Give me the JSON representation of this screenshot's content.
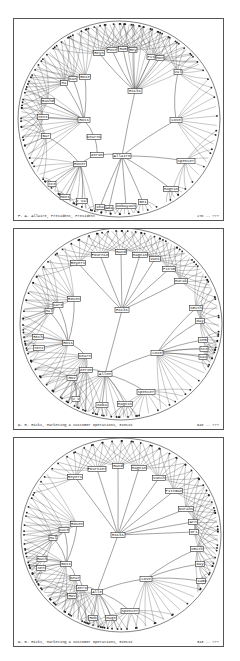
{
  "figure": {
    "panels": [
      {
        "id": "panel-1",
        "top": 18,
        "height": 203,
        "footer": {
          "left": "F. A. Allaire, President, President",
          "right": "278 -- ???"
        },
        "disc": {
          "cx": 105,
          "cy": 100,
          "rx": 101,
          "ry": 98
        },
        "root": "Allaire",
        "nodes": [
          {
            "id": "Allaire",
            "x": 108,
            "y": 137,
            "w": 18
          },
          {
            "id": "Hicks",
            "x": 121,
            "y": 72,
            "w": 14
          },
          {
            "id": "Love",
            "x": 162,
            "y": 101,
            "w": 12
          },
          {
            "id": "Spencer",
            "x": 172,
            "y": 142,
            "w": 18
          },
          {
            "id": "Magnin",
            "x": 157,
            "y": 170,
            "w": 15
          },
          {
            "id": "Bei",
            "x": 129,
            "y": 183,
            "w": 9
          },
          {
            "id": "Kobayash",
            "x": 112,
            "y": 187,
            "w": 20
          },
          {
            "id": "Ada",
            "x": 95,
            "y": 189,
            "w": 8
          },
          {
            "id": "Cha",
            "x": 86,
            "y": 188,
            "w": 9
          },
          {
            "id": "Zeron",
            "x": 83,
            "y": 136,
            "w": 13
          },
          {
            "id": "Kearns",
            "x": 80,
            "y": 118,
            "w": 14
          },
          {
            "id": "Ross",
            "x": 70,
            "y": 101,
            "w": 12
          },
          {
            "id": "Hover",
            "x": 66,
            "y": 145,
            "w": 13
          },
          {
            "id": "Bar",
            "x": 32,
            "y": 117,
            "w": 9
          },
          {
            "id": "Ste",
            "x": 38,
            "y": 165,
            "w": 8
          },
          {
            "id": "Mont",
            "x": 51,
            "y": 178,
            "w": 10
          },
          {
            "id": "J Val",
            "x": 68,
            "y": 182,
            "w": 11
          },
          {
            "id": "Rashd",
            "x": 34,
            "y": 82,
            "w": 13
          },
          {
            "id": "Sent",
            "x": 29,
            "y": 98,
            "w": 11
          },
          {
            "id": "Ma",
            "x": 50,
            "y": 64,
            "w": 7
          },
          {
            "id": "Can",
            "x": 59,
            "y": 60,
            "w": 8
          },
          {
            "id": "Rose",
            "x": 71,
            "y": 58,
            "w": 11
          },
          {
            "id": "Reyn",
            "x": 85,
            "y": 34,
            "w": 11
          },
          {
            "id": "Four",
            "x": 98,
            "y": 31,
            "w": 10
          },
          {
            "id": "Ham",
            "x": 109,
            "y": 30,
            "w": 9
          },
          {
            "id": "Rey",
            "x": 119,
            "y": 31,
            "w": 8
          },
          {
            "id": "Pit",
            "x": 137,
            "y": 38,
            "w": 8
          },
          {
            "id": "Mon",
            "x": 146,
            "y": 39,
            "w": 8
          },
          {
            "id": "Val",
            "x": 164,
            "y": 53,
            "w": 8
          }
        ],
        "edges": [
          [
            "Allaire",
            "Hicks"
          ],
          [
            "Allaire",
            "Love"
          ],
          [
            "Allaire",
            "Spencer"
          ],
          [
            "Allaire",
            "Magnin"
          ],
          [
            "Allaire",
            "Bei"
          ],
          [
            "Allaire",
            "Kobayash"
          ],
          [
            "Allaire",
            "Ada"
          ],
          [
            "Allaire",
            "Cha"
          ],
          [
            "Allaire",
            "Zeron"
          ],
          [
            "Zeron",
            "Kearns"
          ],
          [
            "Kearns",
            "Ross"
          ],
          [
            "Zeron",
            "Hover"
          ],
          [
            "Hover",
            "Bar"
          ],
          [
            "Hover",
            "Ste"
          ],
          [
            "Hover",
            "Mont"
          ],
          [
            "Hover",
            "J Val"
          ],
          [
            "Ross",
            "Rashd"
          ],
          [
            "Ross",
            "Sent"
          ],
          [
            "Ross",
            "Ma"
          ],
          [
            "Ross",
            "Can"
          ],
          [
            "Ross",
            "Rose"
          ],
          [
            "Hicks",
            "Reyn"
          ],
          [
            "Hicks",
            "Four"
          ],
          [
            "Hicks",
            "Ham"
          ],
          [
            "Hicks",
            "Rey"
          ],
          [
            "Hicks",
            "Pit"
          ],
          [
            "Hicks",
            "Mon"
          ],
          [
            "Love",
            "Val"
          ]
        ]
      },
      {
        "id": "panel-2",
        "top": 228,
        "height": 202,
        "footer": {
          "left": "W. R. Hicks, Marketing & Customer Operations, Execut",
          "right": "648 -- ???"
        },
        "disc": {
          "cx": 107,
          "cy": 95,
          "rx": 101,
          "ry": 96
        },
        "root": "Hicks",
        "nodes": [
          {
            "id": "Hicks",
            "x": 108,
            "y": 81,
            "w": 14
          },
          {
            "id": "Allen",
            "x": 91,
            "y": 145,
            "w": 14
          },
          {
            "id": "Zeron",
            "x": 72,
            "y": 141,
            "w": 13
          },
          {
            "id": "Kearn",
            "x": 71,
            "y": 127,
            "w": 13
          },
          {
            "id": "Ross",
            "x": 54,
            "y": 114,
            "w": 11
          },
          {
            "id": "Hov",
            "x": 58,
            "y": 149,
            "w": 10
          },
          {
            "id": "J V",
            "x": 62,
            "y": 170,
            "w": 8
          },
          {
            "id": "Koba",
            "x": 88,
            "y": 176,
            "w": 12
          },
          {
            "id": "Magnin",
            "x": 111,
            "y": 175,
            "w": 15
          },
          {
            "id": "Spencer",
            "x": 132,
            "y": 163,
            "w": 18
          },
          {
            "id": "Love",
            "x": 143,
            "y": 124,
            "w": 12
          },
          {
            "id": "Smith",
            "x": 182,
            "y": 79,
            "w": 13
          },
          {
            "id": "Day",
            "x": 186,
            "y": 92,
            "w": 9
          },
          {
            "id": "Cem",
            "x": 189,
            "y": 111,
            "w": 9
          },
          {
            "id": "Ste",
            "x": 190,
            "y": 120,
            "w": 8
          },
          {
            "id": "Sau",
            "x": 189,
            "y": 128,
            "w": 8
          },
          {
            "id": "Rosen",
            "x": 60,
            "y": 70,
            "w": 13
          },
          {
            "id": "Care",
            "x": 44,
            "y": 76,
            "w": 10
          },
          {
            "id": "Mal",
            "x": 35,
            "y": 82,
            "w": 8
          },
          {
            "id": "Rech",
            "x": 24,
            "y": 108,
            "w": 11
          },
          {
            "id": "Sent",
            "x": 25,
            "y": 119,
            "w": 11
          },
          {
            "id": "Reyers",
            "x": 64,
            "y": 34,
            "w": 15
          },
          {
            "id": "Fournie",
            "x": 86,
            "y": 26,
            "w": 17
          },
          {
            "id": "Rand",
            "x": 107,
            "y": 23,
            "w": 11
          },
          {
            "id": "Magnin2",
            "label": "Magnin",
            "x": 126,
            "y": 26,
            "w": 15
          },
          {
            "id": "Vanc",
            "x": 141,
            "y": 30,
            "w": 11
          },
          {
            "id": "Pittm",
            "x": 155,
            "y": 40,
            "w": 13
          },
          {
            "id": "Murak",
            "x": 167,
            "y": 52,
            "w": 13
          }
        ],
        "edges": [
          [
            "Hicks",
            "Allen"
          ],
          [
            "Allen",
            "Zeron"
          ],
          [
            "Zeron",
            "Kearn"
          ],
          [
            "Kearn",
            "Ross"
          ],
          [
            "Zeron",
            "Hov"
          ],
          [
            "Hov",
            "J V"
          ],
          [
            "Allen",
            "Koba"
          ],
          [
            "Allen",
            "Magnin"
          ],
          [
            "Allen",
            "Spencer"
          ],
          [
            "Allen",
            "Love"
          ],
          [
            "Love",
            "Smith"
          ],
          [
            "Love",
            "Day"
          ],
          [
            "Love",
            "Cem"
          ],
          [
            "Love",
            "Ste"
          ],
          [
            "Love",
            "Sau"
          ],
          [
            "Ross",
            "Rosen"
          ],
          [
            "Ross",
            "Care"
          ],
          [
            "Ross",
            "Mal"
          ],
          [
            "Ross",
            "Rech"
          ],
          [
            "Ross",
            "Sent"
          ],
          [
            "Hicks",
            "Reyers"
          ],
          [
            "Hicks",
            "Fournie"
          ],
          [
            "Hicks",
            "Rand"
          ],
          [
            "Hicks",
            "Magnin2"
          ],
          [
            "Hicks",
            "Vanc"
          ],
          [
            "Hicks",
            "Pittm"
          ],
          [
            "Hicks",
            "Murak"
          ]
        ]
      },
      {
        "id": "panel-3",
        "top": 437,
        "height": 210,
        "footer": {
          "left": "W. R. Hicks, Marketing & Customer Operations, Execut",
          "right": "343 -- ???"
        },
        "disc": {
          "cx": 107,
          "cy": 97,
          "rx": 100,
          "ry": 97
        },
        "root": "Hicks",
        "nodes": [
          {
            "id": "Hicks",
            "x": 104,
            "y": 97,
            "w": 14
          },
          {
            "id": "Reyers",
            "x": 61,
            "y": 39,
            "w": 15
          },
          {
            "id": "Fournier",
            "x": 83,
            "y": 31,
            "w": 18
          },
          {
            "id": "Rand",
            "x": 104,
            "y": 28,
            "w": 11
          },
          {
            "id": "Magnin",
            "x": 125,
            "y": 30,
            "w": 15
          },
          {
            "id": "Vanch",
            "x": 145,
            "y": 40,
            "w": 13
          },
          {
            "id": "Pittman",
            "x": 160,
            "y": 53,
            "w": 17
          },
          {
            "id": "Nurahs",
            "x": 172,
            "y": 71,
            "w": 15
          },
          {
            "id": "Arn",
            "x": 179,
            "y": 84,
            "w": 9
          },
          {
            "id": "Dri",
            "x": 180,
            "y": 94,
            "w": 9
          },
          {
            "id": "Smith",
            "x": 183,
            "y": 111,
            "w": 13
          },
          {
            "id": "Day",
            "x": 186,
            "y": 126,
            "w": 9
          },
          {
            "id": "Cam",
            "x": 187,
            "y": 143,
            "w": 9
          },
          {
            "id": "Love",
            "x": 132,
            "y": 141,
            "w": 12
          },
          {
            "id": "Alle",
            "x": 83,
            "y": 154,
            "w": 11
          },
          {
            "id": "Zero",
            "x": 68,
            "y": 150,
            "w": 11
          },
          {
            "id": "Kear",
            "x": 61,
            "y": 140,
            "w": 10
          },
          {
            "id": "Ross",
            "x": 52,
            "y": 126,
            "w": 11
          },
          {
            "id": "Hov",
            "x": 58,
            "y": 158,
            "w": 9
          },
          {
            "id": "Rob",
            "x": 79,
            "y": 180,
            "w": 9
          },
          {
            "id": "Mage",
            "x": 97,
            "y": 180,
            "w": 11
          },
          {
            "id": "Spencer",
            "x": 116,
            "y": 173,
            "w": 18
          },
          {
            "id": "Rosen",
            "x": 63,
            "y": 86,
            "w": 13
          },
          {
            "id": "Cace",
            "x": 50,
            "y": 92,
            "w": 10
          },
          {
            "id": "Mal",
            "x": 39,
            "y": 100,
            "w": 8
          },
          {
            "id": "Rach",
            "x": 28,
            "y": 121,
            "w": 10
          },
          {
            "id": "Sen",
            "x": 27,
            "y": 130,
            "w": 9
          }
        ],
        "edges": [
          [
            "Hicks",
            "Reyers"
          ],
          [
            "Hicks",
            "Fournier"
          ],
          [
            "Hicks",
            "Rand"
          ],
          [
            "Hicks",
            "Magnin"
          ],
          [
            "Hicks",
            "Vanch"
          ],
          [
            "Hicks",
            "Pittman"
          ],
          [
            "Hicks",
            "Nurahs"
          ],
          [
            "Hicks",
            "Arn"
          ],
          [
            "Hicks",
            "Dri"
          ],
          [
            "Hicks",
            "Alle"
          ],
          [
            "Alle",
            "Love"
          ],
          [
            "Love",
            "Smith"
          ],
          [
            "Love",
            "Day"
          ],
          [
            "Love",
            "Cam"
          ],
          [
            "Alle",
            "Zero"
          ],
          [
            "Zero",
            "Kear"
          ],
          [
            "Kear",
            "Ross"
          ],
          [
            "Zero",
            "Hov"
          ],
          [
            "Alle",
            "Rob"
          ],
          [
            "Alle",
            "Mage"
          ],
          [
            "Alle",
            "Spencer"
          ],
          [
            "Ross",
            "Rosen"
          ],
          [
            "Ross",
            "Cace"
          ],
          [
            "Ross",
            "Mal"
          ],
          [
            "Ross",
            "Rach"
          ],
          [
            "Ross",
            "Sen"
          ]
        ]
      }
    ]
  },
  "labels": {
    "p1_footer_left": "F. A. Allaire, President, President",
    "p1_footer_right": "278 -- ???",
    "p2_footer_left": "W. R. Hicks, Marketing & Customer Operations, Execut",
    "p2_footer_right": "648 -- ???",
    "p3_footer_left": "W. R. Hicks, Marketing & Customer Operations, Execut",
    "p3_footer_right": "343 -- ???"
  }
}
